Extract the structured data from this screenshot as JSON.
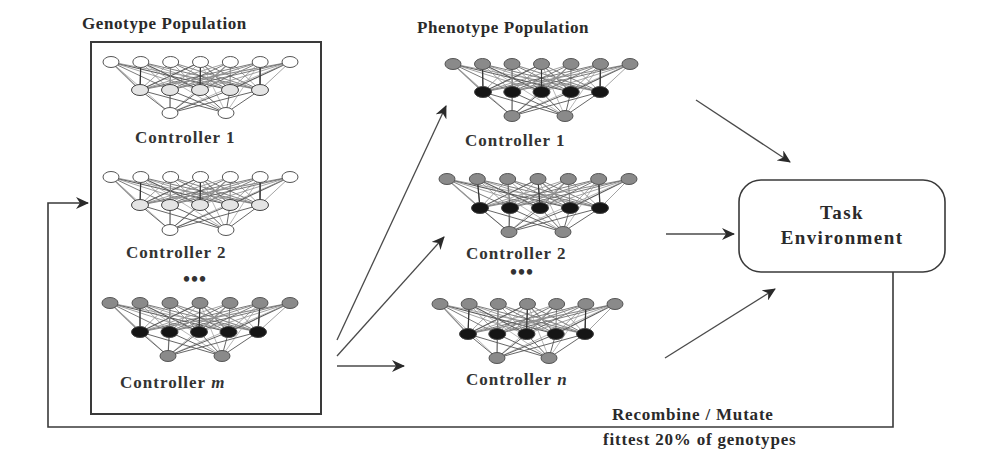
{
  "genotype_panel": {
    "title": "Genotype Population",
    "box": {
      "x": 91,
      "y": 42,
      "w": 230,
      "h": 372
    },
    "controllers": [
      {
        "label": "Controller 1",
        "var": "",
        "label_x": 135,
        "label_y": 143,
        "top": {
          "y": 62,
          "x0": 111,
          "x1": 290,
          "fill": "#ffffff"
        },
        "mid": {
          "y": 90,
          "x0": 140,
          "x1": 260,
          "fill": "#e4e4e4"
        },
        "bot": {
          "y": 113,
          "xs": [
            170,
            226
          ],
          "fill": "#ffffff"
        }
      },
      {
        "label": "Controller 2",
        "var": "",
        "label_x": 126,
        "label_y": 258,
        "top": {
          "y": 177,
          "x0": 111,
          "x1": 290,
          "fill": "#ffffff"
        },
        "mid": {
          "y": 205,
          "x0": 140,
          "x1": 260,
          "fill": "#e4e4e4"
        },
        "bot": {
          "y": 230,
          "xs": [
            170,
            226
          ],
          "fill": "#ffffff"
        }
      },
      {
        "label": "Controller ",
        "var": "m",
        "label_x": 120,
        "label_y": 388,
        "top": {
          "y": 303,
          "x0": 110,
          "x1": 290,
          "fill": "#8a8a8a"
        },
        "mid": {
          "y": 332,
          "x0": 140,
          "x1": 258,
          "fill": "#151515"
        },
        "bot": {
          "y": 356,
          "xs": [
            168,
            222
          ],
          "fill": "#8a8a8a"
        }
      }
    ],
    "ellipsis": "•••",
    "ellipsis_pos": {
      "x": 183,
      "y": 286
    }
  },
  "phenotype_panel": {
    "title": "Phenotype Population",
    "controllers": [
      {
        "label": "Controller 1",
        "var": "",
        "label_x": 465,
        "label_y": 146,
        "top": {
          "y": 64,
          "x0": 453,
          "x1": 630,
          "fill": "#8a8a8a"
        },
        "mid": {
          "y": 92,
          "x0": 483,
          "x1": 600,
          "fill": "#151515"
        },
        "bot": {
          "y": 116,
          "xs": [
            512,
            565
          ],
          "fill": "#8a8a8a"
        }
      },
      {
        "label": "Controller 2",
        "var": "",
        "label_x": 466,
        "label_y": 259,
        "top": {
          "y": 179,
          "x0": 447,
          "x1": 629,
          "fill": "#8a8a8a"
        },
        "mid": {
          "y": 208,
          "x0": 480,
          "x1": 600,
          "fill": "#151515"
        },
        "bot": {
          "y": 232,
          "xs": [
            509,
            563
          ],
          "fill": "#8a8a8a"
        }
      },
      {
        "label": "Controller ",
        "var": "n",
        "label_x": 466,
        "label_y": 385,
        "top": {
          "y": 304,
          "x0": 440,
          "x1": 615,
          "fill": "#8a8a8a"
        },
        "mid": {
          "y": 334,
          "x0": 468,
          "x1": 585,
          "fill": "#151515"
        },
        "bot": {
          "y": 358,
          "xs": [
            497,
            549
          ],
          "fill": "#8a8a8a"
        }
      }
    ],
    "ellipsis": "•••",
    "ellipsis_pos": {
      "x": 510,
      "y": 279
    }
  },
  "task_environment": {
    "label_line1": "Task",
    "label_line2": "Environment",
    "box": {
      "x": 739,
      "y": 180,
      "w": 206,
      "h": 92,
      "r": 22
    }
  },
  "feedback": {
    "caption_line1": "Recombine / Mutate",
    "caption_line2": "fittest 20% of genotypes"
  },
  "arrows": [
    {
      "name": "genotype-to-phenotype-1",
      "x1": 337,
      "y1": 340,
      "x2": 446,
      "y2": 106
    },
    {
      "name": "genotype-to-phenotype-2",
      "x1": 337,
      "y1": 356,
      "x2": 444,
      "y2": 237
    },
    {
      "name": "genotype-to-phenotype-n",
      "x1": 337,
      "y1": 366,
      "x2": 404,
      "y2": 366
    },
    {
      "name": "phenotype-1-to-task",
      "x1": 696,
      "y1": 100,
      "x2": 790,
      "y2": 162
    },
    {
      "name": "phenotype-2-to-task",
      "x1": 666,
      "y1": 234,
      "x2": 734,
      "y2": 234
    },
    {
      "name": "phenotype-n-to-task",
      "x1": 665,
      "y1": 358,
      "x2": 775,
      "y2": 289
    }
  ],
  "colors": {
    "line": "#3a3a3a",
    "edge": "#6e6e6e",
    "text": "#2a2a2a"
  }
}
